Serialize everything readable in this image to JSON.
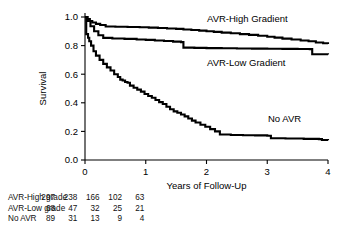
{
  "chart_data": {
    "type": "line",
    "title": "",
    "xlabel": "Years of Follow-Up",
    "ylabel": "Survival",
    "xlim": [
      0,
      4
    ],
    "ylim": [
      0.0,
      1.0
    ],
    "xticks": [
      0,
      1,
      2,
      3,
      4
    ],
    "xticklabels": [
      "0",
      "1",
      "2",
      "3",
      "4"
    ],
    "yticks": [
      0.0,
      0.2,
      0.4,
      0.6,
      0.8,
      1.0
    ],
    "yticklabels": [
      "0.0",
      "0.2",
      "0.4",
      "0.6",
      "0.8",
      "1.0"
    ],
    "grid": false,
    "legend_position": "inline-annotations",
    "series": [
      {
        "name": "AVR-High Gradient",
        "label_text": "AVR-High Gradient",
        "color": "#000000",
        "x": [
          0.0,
          0.04,
          0.08,
          0.12,
          0.18,
          0.25,
          0.34,
          0.5,
          0.7,
          0.9,
          1.05,
          1.2,
          1.35,
          1.5,
          1.62,
          1.75,
          1.88,
          2.0,
          2.12,
          2.25,
          2.4,
          2.55,
          2.7,
          2.85,
          3.0,
          3.12,
          3.25,
          3.4,
          3.55,
          3.68,
          3.8,
          3.92,
          4.0
        ],
        "y": [
          1.0,
          0.985,
          0.972,
          0.962,
          0.952,
          0.944,
          0.934,
          0.932,
          0.93,
          0.928,
          0.926,
          0.923,
          0.92,
          0.917,
          0.913,
          0.909,
          0.905,
          0.9,
          0.896,
          0.891,
          0.886,
          0.88,
          0.875,
          0.869,
          0.862,
          0.856,
          0.849,
          0.843,
          0.836,
          0.83,
          0.822,
          0.816,
          0.812
        ]
      },
      {
        "name": "AVR-Low Gradient",
        "label_text": "AVR-Low Gradient",
        "color": "#000000",
        "x": [
          0.0,
          0.04,
          0.09,
          0.15,
          0.22,
          0.3,
          0.45,
          0.65,
          0.85,
          1.0,
          1.15,
          1.3,
          1.45,
          1.58,
          1.62,
          1.8,
          2.0,
          2.25,
          2.5,
          2.75,
          3.0,
          3.25,
          3.5,
          3.7,
          3.74,
          3.9,
          4.0
        ],
        "y": [
          1.0,
          0.972,
          0.935,
          0.9,
          0.872,
          0.854,
          0.85,
          0.847,
          0.843,
          0.84,
          0.836,
          0.832,
          0.828,
          0.824,
          0.786,
          0.784,
          0.782,
          0.781,
          0.78,
          0.779,
          0.778,
          0.777,
          0.776,
          0.775,
          0.74,
          0.739,
          0.738
        ]
      },
      {
        "name": "No AVR",
        "label_text": "No AVR",
        "color": "#000000",
        "x": [
          0.0,
          0.02,
          0.05,
          0.07,
          0.1,
          0.14,
          0.18,
          0.24,
          0.3,
          0.36,
          0.42,
          0.48,
          0.54,
          0.58,
          0.62,
          0.66,
          0.7,
          0.74,
          0.8,
          0.86,
          0.92,
          0.98,
          1.04,
          1.1,
          1.16,
          1.22,
          1.28,
          1.34,
          1.4,
          1.46,
          1.52,
          1.58,
          1.64,
          1.7,
          1.76,
          1.82,
          1.9,
          1.98,
          2.06,
          2.14,
          2.22,
          2.4,
          2.6,
          2.8,
          3.0,
          3.06,
          3.3,
          3.6,
          3.85,
          3.9,
          4.0
        ],
        "y": [
          1.0,
          0.88,
          0.855,
          0.83,
          0.8,
          0.76,
          0.73,
          0.7,
          0.672,
          0.648,
          0.626,
          0.6,
          0.58,
          0.562,
          0.556,
          0.545,
          0.54,
          0.52,
          0.505,
          0.492,
          0.478,
          0.462,
          0.448,
          0.435,
          0.42,
          0.405,
          0.392,
          0.372,
          0.355,
          0.34,
          0.33,
          0.318,
          0.305,
          0.29,
          0.275,
          0.262,
          0.246,
          0.232,
          0.216,
          0.2,
          0.178,
          0.175,
          0.173,
          0.172,
          0.17,
          0.152,
          0.15,
          0.148,
          0.146,
          0.14,
          0.138
        ]
      }
    ],
    "annotations": [
      {
        "text": "AVR-High Gradient",
        "x_px": 207,
        "y_px": 22
      },
      {
        "text": "AVR-Low Gradient",
        "x_px": 207,
        "y_px": 66
      },
      {
        "text": "No AVR",
        "x_px": 268,
        "y_px": 122
      }
    ]
  },
  "risk_table": {
    "rows": [
      {
        "label": "AVR-High grade",
        "values": [
          "297",
          "238",
          "166",
          "102",
          "63"
        ]
      },
      {
        "label": "AVR-Low grade",
        "values": [
          "68",
          "47",
          "32",
          "25",
          "21"
        ]
      },
      {
        "label": "No AVR",
        "values": [
          "89",
          "31",
          "13",
          "9",
          "4"
        ]
      }
    ],
    "value_columns_px": [
      165,
      232,
      299,
      366,
      433
    ]
  }
}
